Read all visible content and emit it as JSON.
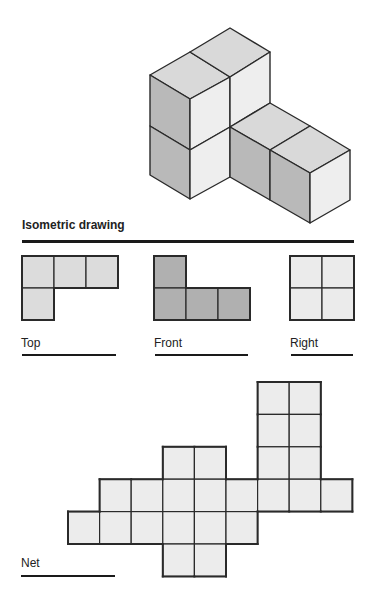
{
  "title": "Isometric drawing",
  "colors": {
    "stroke": "#2a2a2a",
    "iso_top": "#d9d9d9",
    "iso_left": "#b9b9b9",
    "iso_right": "#eeeeee",
    "top_view": "#dcdcdc",
    "front_view": "#b0b0b0",
    "right_view": "#ebebeb",
    "net": "#ececec"
  },
  "isometric": {
    "faces": [
      {
        "name": "top-face-front-left",
        "fill": "iso_top",
        "points": [
          [
            150,
            75
          ],
          [
            190,
            52
          ],
          [
            230,
            77
          ],
          [
            190,
            99
          ]
        ]
      },
      {
        "name": "top-face-back",
        "fill": "iso_top",
        "points": [
          [
            190,
            52
          ],
          [
            230,
            28
          ],
          [
            270,
            52
          ],
          [
            230,
            77
          ]
        ]
      },
      {
        "name": "left-face-upper",
        "fill": "iso_left",
        "points": [
          [
            150,
            75
          ],
          [
            190,
            99
          ],
          [
            190,
            150
          ],
          [
            150,
            126
          ]
        ]
      },
      {
        "name": "left-face-lower",
        "fill": "iso_left",
        "points": [
          [
            150,
            126
          ],
          [
            190,
            150
          ],
          [
            190,
            199
          ],
          [
            150,
            175
          ]
        ]
      },
      {
        "name": "front-face-upper",
        "fill": "iso_right",
        "points": [
          [
            190,
            99
          ],
          [
            230,
            77
          ],
          [
            230,
            127
          ],
          [
            190,
            150
          ]
        ]
      },
      {
        "name": "front-face-lower",
        "fill": "iso_right",
        "points": [
          [
            190,
            150
          ],
          [
            230,
            127
          ],
          [
            230,
            177
          ],
          [
            190,
            199
          ]
        ]
      },
      {
        "name": "right-face-back-upper",
        "fill": "iso_right",
        "points": [
          [
            230,
            77
          ],
          [
            270,
            52
          ],
          [
            270,
            103
          ],
          [
            230,
            127
          ]
        ]
      },
      {
        "name": "top-face-right-block-1",
        "fill": "iso_top",
        "points": [
          [
            230,
            127
          ],
          [
            270,
            103
          ],
          [
            310,
            126
          ],
          [
            270,
            150
          ]
        ]
      },
      {
        "name": "top-face-right-block-2",
        "fill": "iso_top",
        "points": [
          [
            270,
            150
          ],
          [
            310,
            126
          ],
          [
            350,
            150
          ],
          [
            310,
            173
          ]
        ]
      },
      {
        "name": "left-face-right-block-1",
        "fill": "iso_left",
        "points": [
          [
            230,
            127
          ],
          [
            270,
            150
          ],
          [
            270,
            200
          ],
          [
            230,
            177
          ]
        ]
      },
      {
        "name": "left-face-right-block-2",
        "fill": "iso_left",
        "points": [
          [
            270,
            150
          ],
          [
            310,
            173
          ],
          [
            310,
            223
          ],
          [
            270,
            200
          ]
        ]
      },
      {
        "name": "right-face-right-block",
        "fill": "iso_right",
        "points": [
          [
            310,
            173
          ],
          [
            350,
            150
          ],
          [
            350,
            200
          ],
          [
            310,
            223
          ]
        ]
      }
    ]
  },
  "views": [
    {
      "name": "top-view",
      "label": "Top",
      "fill": "top_view",
      "origin": [
        22,
        256
      ],
      "cell": 32,
      "cells": [
        [
          0,
          0
        ],
        [
          1,
          0
        ],
        [
          2,
          0
        ],
        [
          0,
          1
        ]
      ],
      "label_pos": [
        21,
        336
      ],
      "rule": [
        22,
        354,
        94
      ]
    },
    {
      "name": "front-view",
      "label": "Front",
      "fill": "front_view",
      "origin": [
        154,
        256
      ],
      "cell": 32,
      "cells": [
        [
          0,
          0
        ],
        [
          0,
          1
        ],
        [
          1,
          1
        ],
        [
          2,
          1
        ]
      ],
      "label_pos": [
        154,
        336
      ],
      "rule": [
        155,
        354,
        93
      ]
    },
    {
      "name": "right-view",
      "label": "Right",
      "fill": "right_view",
      "origin": [
        290,
        256
      ],
      "cell": 32,
      "cells": [
        [
          0,
          0
        ],
        [
          1,
          0
        ],
        [
          0,
          1
        ],
        [
          1,
          1
        ]
      ],
      "label_pos": [
        290,
        336
      ],
      "rule": [
        291,
        354,
        62
      ]
    },
    {
      "name": "net",
      "label": "Net",
      "fill": "net",
      "origin": [
        68,
        382
      ],
      "cell": 31.6,
      "cell_h": 32.4,
      "cells": [
        [
          6,
          0
        ],
        [
          7,
          0
        ],
        [
          6,
          1
        ],
        [
          7,
          1
        ],
        [
          3,
          2
        ],
        [
          4,
          2
        ],
        [
          6,
          2
        ],
        [
          7,
          2
        ],
        [
          1,
          3
        ],
        [
          2,
          3
        ],
        [
          3,
          3
        ],
        [
          4,
          3
        ],
        [
          5,
          3
        ],
        [
          6,
          3
        ],
        [
          7,
          3
        ],
        [
          8,
          3
        ],
        [
          0,
          4
        ],
        [
          1,
          4
        ],
        [
          2,
          4
        ],
        [
          3,
          4
        ],
        [
          4,
          4
        ],
        [
          5,
          4
        ],
        [
          3,
          5
        ],
        [
          4,
          5
        ]
      ],
      "label_pos": [
        21,
        556
      ],
      "rule": [
        21,
        575,
        94
      ]
    }
  ],
  "title_rule": [
    22,
    240,
    332
  ],
  "title_pos": [
    22,
    218
  ]
}
